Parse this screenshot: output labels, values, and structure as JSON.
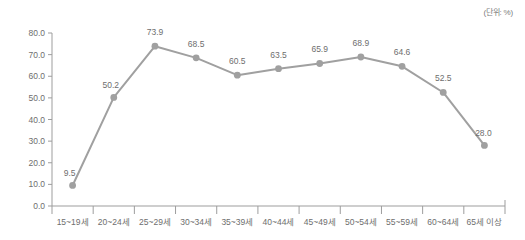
{
  "unit_note": "(단위: %)",
  "chart_data": {
    "type": "line",
    "title": "",
    "xlabel": "",
    "ylabel": "",
    "ylim": [
      0,
      80
    ],
    "ytick_step": 10,
    "grid": false,
    "legend": "none",
    "line_color": "#a0a0a0",
    "marker_color": "#a0a0a0",
    "axis_color": "#9d9d9d",
    "text_color": "#6e6e6e",
    "categories": [
      "15~19세",
      "20~24세",
      "25~29세",
      "30~34세",
      "35~39세",
      "40~44세",
      "45~49세",
      "50~54세",
      "55~59세",
      "60~64세",
      "65세 이상"
    ],
    "values": [
      9.5,
      50.2,
      73.9,
      68.5,
      60.5,
      63.5,
      65.9,
      68.9,
      64.6,
      52.5,
      28.0
    ],
    "value_labels": [
      "9.5",
      "50.2",
      "73.9",
      "68.5",
      "60.5",
      "63.5",
      "65.9",
      "68.9",
      "64.6",
      "52.5",
      "28.0"
    ],
    "ytick_labels": [
      "0.0",
      "10.0",
      "20.0",
      "30.0",
      "40.0",
      "50.0",
      "60.0",
      "70.0",
      "80.0"
    ],
    "ytick_values": [
      0,
      10,
      20,
      30,
      40,
      50,
      60,
      70,
      80
    ]
  }
}
